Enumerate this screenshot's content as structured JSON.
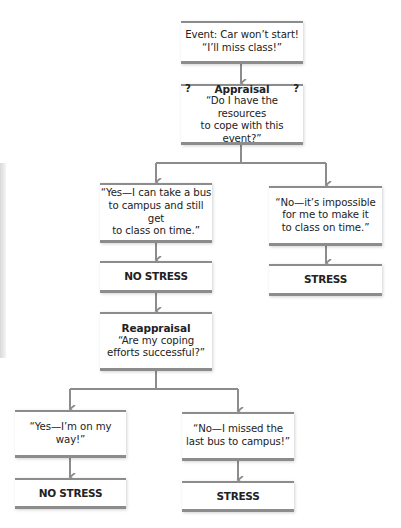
{
  "diagram": {
    "event": {
      "line1": "Event: Car won’t start!",
      "line2": "“I’ll miss class!”"
    },
    "appraisal": {
      "q_left": "?",
      "title": "Appraisal",
      "q_right": "?",
      "line1": "“Do I have the resources",
      "line2": "to cope with this event?”"
    },
    "yes1": {
      "line1": "“Yes—I can take a bus",
      "line2": "to campus and still get",
      "line3": "to class on time.”"
    },
    "no1": {
      "line1": "“No—it’s impossible",
      "line2": "for me to make it",
      "line3": "to class on time.”"
    },
    "no_stress_1": "NO STRESS",
    "stress_1": "STRESS",
    "reappraisal": {
      "title": "Reappraisal",
      "line1": "“Are my coping",
      "line2": "efforts successful?”"
    },
    "yes2": {
      "line1": "“Yes—I’m on my way!”"
    },
    "no2": {
      "line1": "“No—I missed the",
      "line2": "last bus to campus!”"
    },
    "no_stress_2": "NO STRESS",
    "stress_2": "STRESS",
    "colors": {
      "line": "#8c8c8c",
      "box_fill": "#ffffff",
      "text": "#222222"
    }
  }
}
